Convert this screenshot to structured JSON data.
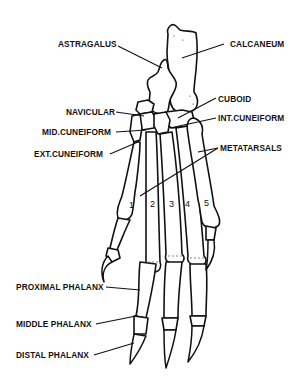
{
  "diagram": {
    "colors": {
      "line": "#111111",
      "background": "#ffffff"
    },
    "labels": {
      "astragalus": "ASTRAGALUS",
      "calcaneum": "CALCANEUM",
      "navicular": "NAVICULAR",
      "cuboid": "CUBOID",
      "mid_cuneiform": "MID.CUNEIFORM",
      "int_cuneiform": "INT.CUNEIFORM",
      "ext_cuneiform": "EXT.CUNEIFORM",
      "metatarsals": "METATARSALS",
      "proximal_phalanx": "PROXIMAL PHALANX",
      "middle_phalanx": "MIDDLE PHALANX",
      "distal_phalanx": "DISTAL PHALANX"
    },
    "digit_numbers": [
      "1",
      "2",
      "3",
      "4",
      "5"
    ]
  }
}
